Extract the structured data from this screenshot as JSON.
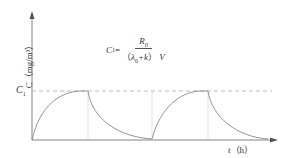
{
  "axes": {
    "y_label": "C（mg/m³）",
    "x_label_var": "t",
    "x_label_unit": "（h）"
  },
  "reference_line": {
    "label_main": "C",
    "label_sub": "1"
  },
  "formula": {
    "lhs_main": "C",
    "lhs_sub": "1",
    "equals": "=",
    "numerator_main": "R",
    "numerator_sub": "0",
    "den_open": "（",
    "den_lambda": "λ",
    "den_lambda_sub": "0",
    "den_plus_k": "+k",
    "den_close": "）",
    "den_V": "V"
  },
  "colors": {
    "curve": "#888888",
    "axis": "#666666",
    "dashed": "#aaaaaa",
    "guide": "#cccccc"
  }
}
